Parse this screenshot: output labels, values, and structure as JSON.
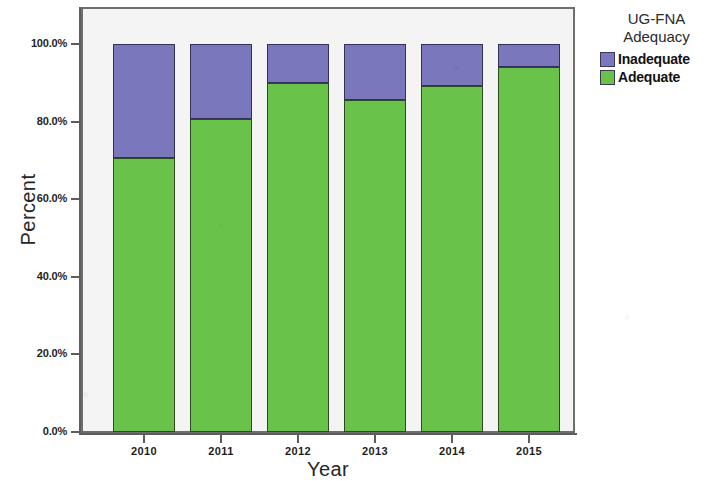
{
  "chart_data": {
    "type": "bar",
    "subtype": "stacked-100-percent",
    "title": "",
    "xlabel": "Year",
    "ylabel": "Percent",
    "categories": [
      "2010",
      "2011",
      "2012",
      "2013",
      "2014",
      "2015"
    ],
    "series": [
      {
        "name": "Adequate",
        "color": "#69c24a",
        "values": [
          70.6,
          80.7,
          90.0,
          85.6,
          89.2,
          94.1
        ]
      },
      {
        "name": "Inadequate",
        "color": "#7b77bd",
        "values": [
          29.4,
          19.3,
          10.0,
          14.4,
          10.8,
          5.9
        ]
      }
    ],
    "ylim": [
      0,
      100
    ],
    "yticks": [
      0,
      20,
      40,
      60,
      80,
      100
    ],
    "ytick_labels": [
      "0.0%",
      "20.0%",
      "40.0%",
      "60.0%",
      "80.0%",
      "100.0%"
    ],
    "grid": false,
    "legend_position": "right",
    "legend_title": "UG-FNA\nAdequacy",
    "stack_order_top_to_bottom": [
      "Inadequate",
      "Adequate"
    ]
  },
  "axes": {
    "y_title": "Percent",
    "x_title": "Year"
  },
  "legend": {
    "title": "UG-FNA\nAdequacy",
    "entries": [
      {
        "label": "Inadequate",
        "color": "#7b77bd"
      },
      {
        "label": "Adequate",
        "color": "#69c24a"
      }
    ]
  },
  "colors": {
    "adequate": "#69c24a",
    "inadequate": "#7b77bd",
    "plot_background": "#f3f4f3",
    "frame": "#6e6e6e",
    "page_background": "#ffffff"
  }
}
